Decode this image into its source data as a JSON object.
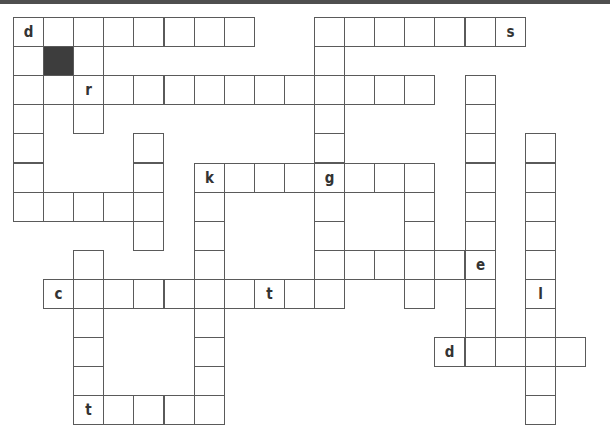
{
  "puzzle": {
    "type": "crossword",
    "origin": {
      "x": 13,
      "y": 17
    },
    "cell_width": 30.1,
    "cell_height": 29.1,
    "colors": {
      "border": "#5a5a5a",
      "black_cell": "#3d3d3d",
      "top_bar": "#4f4f4f",
      "letter": "#333333"
    },
    "cells": [
      {
        "r": 0,
        "c": 0,
        "ch": "d"
      },
      {
        "r": 0,
        "c": 1
      },
      {
        "r": 0,
        "c": 2
      },
      {
        "r": 0,
        "c": 3
      },
      {
        "r": 0,
        "c": 4
      },
      {
        "r": 0,
        "c": 5
      },
      {
        "r": 0,
        "c": 6
      },
      {
        "r": 0,
        "c": 7
      },
      {
        "r": 0,
        "c": 10
      },
      {
        "r": 0,
        "c": 11
      },
      {
        "r": 0,
        "c": 12
      },
      {
        "r": 0,
        "c": 13
      },
      {
        "r": 0,
        "c": 14
      },
      {
        "r": 0,
        "c": 15
      },
      {
        "r": 0,
        "c": 16,
        "ch": "s"
      },
      {
        "r": 1,
        "c": 0
      },
      {
        "r": 1,
        "c": 1,
        "black": true
      },
      {
        "r": 1,
        "c": 2
      },
      {
        "r": 1,
        "c": 10
      },
      {
        "r": 2,
        "c": 0
      },
      {
        "r": 2,
        "c": 1
      },
      {
        "r": 2,
        "c": 2,
        "ch": "r"
      },
      {
        "r": 2,
        "c": 3
      },
      {
        "r": 2,
        "c": 4
      },
      {
        "r": 2,
        "c": 5
      },
      {
        "r": 2,
        "c": 6
      },
      {
        "r": 2,
        "c": 7
      },
      {
        "r": 2,
        "c": 8
      },
      {
        "r": 2,
        "c": 9
      },
      {
        "r": 2,
        "c": 10
      },
      {
        "r": 2,
        "c": 11
      },
      {
        "r": 2,
        "c": 12
      },
      {
        "r": 2,
        "c": 13
      },
      {
        "r": 2,
        "c": 15
      },
      {
        "r": 3,
        "c": 0
      },
      {
        "r": 3,
        "c": 2
      },
      {
        "r": 3,
        "c": 10
      },
      {
        "r": 3,
        "c": 15
      },
      {
        "r": 4,
        "c": 0
      },
      {
        "r": 4,
        "c": 4
      },
      {
        "r": 4,
        "c": 10
      },
      {
        "r": 4,
        "c": 15
      },
      {
        "r": 4,
        "c": 17
      },
      {
        "r": 5,
        "c": 0
      },
      {
        "r": 5,
        "c": 4
      },
      {
        "r": 5,
        "c": 6,
        "ch": "k"
      },
      {
        "r": 5,
        "c": 7
      },
      {
        "r": 5,
        "c": 8
      },
      {
        "r": 5,
        "c": 9
      },
      {
        "r": 5,
        "c": 10,
        "ch": "g"
      },
      {
        "r": 5,
        "c": 11
      },
      {
        "r": 5,
        "c": 12
      },
      {
        "r": 5,
        "c": 13
      },
      {
        "r": 5,
        "c": 15
      },
      {
        "r": 5,
        "c": 17
      },
      {
        "r": 6,
        "c": 0
      },
      {
        "r": 6,
        "c": 1
      },
      {
        "r": 6,
        "c": 2
      },
      {
        "r": 6,
        "c": 3
      },
      {
        "r": 6,
        "c": 4
      },
      {
        "r": 6,
        "c": 6
      },
      {
        "r": 6,
        "c": 10
      },
      {
        "r": 6,
        "c": 13
      },
      {
        "r": 6,
        "c": 15
      },
      {
        "r": 6,
        "c": 17
      },
      {
        "r": 7,
        "c": 4
      },
      {
        "r": 7,
        "c": 6
      },
      {
        "r": 7,
        "c": 10
      },
      {
        "r": 7,
        "c": 13
      },
      {
        "r": 7,
        "c": 15
      },
      {
        "r": 7,
        "c": 17
      },
      {
        "r": 8,
        "c": 2
      },
      {
        "r": 8,
        "c": 6
      },
      {
        "r": 8,
        "c": 10
      },
      {
        "r": 8,
        "c": 11
      },
      {
        "r": 8,
        "c": 12
      },
      {
        "r": 8,
        "c": 13
      },
      {
        "r": 8,
        "c": 14
      },
      {
        "r": 8,
        "c": 15,
        "ch": "e"
      },
      {
        "r": 8,
        "c": 17
      },
      {
        "r": 9,
        "c": 1,
        "ch": "c"
      },
      {
        "r": 9,
        "c": 2
      },
      {
        "r": 9,
        "c": 3
      },
      {
        "r": 9,
        "c": 4
      },
      {
        "r": 9,
        "c": 5
      },
      {
        "r": 9,
        "c": 6
      },
      {
        "r": 9,
        "c": 7
      },
      {
        "r": 9,
        "c": 8,
        "ch": "t"
      },
      {
        "r": 9,
        "c": 9
      },
      {
        "r": 9,
        "c": 10
      },
      {
        "r": 9,
        "c": 13
      },
      {
        "r": 9,
        "c": 15
      },
      {
        "r": 9,
        "c": 17,
        "ch": "l"
      },
      {
        "r": 10,
        "c": 2
      },
      {
        "r": 10,
        "c": 6
      },
      {
        "r": 10,
        "c": 15
      },
      {
        "r": 10,
        "c": 17
      },
      {
        "r": 11,
        "c": 2
      },
      {
        "r": 11,
        "c": 6
      },
      {
        "r": 11,
        "c": 14,
        "ch": "d"
      },
      {
        "r": 11,
        "c": 15
      },
      {
        "r": 11,
        "c": 16
      },
      {
        "r": 11,
        "c": 17
      },
      {
        "r": 11,
        "c": 18
      },
      {
        "r": 12,
        "c": 2
      },
      {
        "r": 12,
        "c": 6
      },
      {
        "r": 12,
        "c": 17
      },
      {
        "r": 13,
        "c": 2,
        "ch": "t"
      },
      {
        "r": 13,
        "c": 3
      },
      {
        "r": 13,
        "c": 4
      },
      {
        "r": 13,
        "c": 5
      },
      {
        "r": 13,
        "c": 6
      },
      {
        "r": 13,
        "c": 17
      }
    ]
  }
}
